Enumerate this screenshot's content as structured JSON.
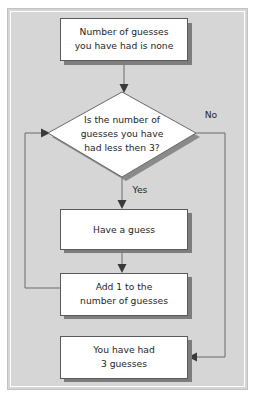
{
  "diagram": {
    "panel": {
      "background_color": "#d6d6d6",
      "border_color": "#c2c2c2"
    },
    "nodes": [
      {
        "id": "start",
        "type": "process",
        "lines": [
          "Number of guesses",
          "you have had is none"
        ]
      },
      {
        "id": "decision",
        "type": "decision",
        "lines": [
          "Is the number of",
          "guesses you have",
          "had less then 3?"
        ]
      },
      {
        "id": "have-guess",
        "type": "process",
        "lines": [
          "Have a guess"
        ]
      },
      {
        "id": "add-one",
        "type": "process",
        "lines": [
          "Add 1 to the",
          "number of guesses"
        ]
      },
      {
        "id": "end",
        "type": "process",
        "lines": [
          "You have had",
          "3 guesses"
        ]
      }
    ],
    "edge_labels": {
      "yes": "Yes",
      "no": "No"
    },
    "colors": {
      "box_fill": "#ffffff",
      "box_border": "#5a5a5a",
      "box_shadow": "#7d7d7d",
      "connector": "#6b6b6b",
      "text": "#262626"
    }
  }
}
